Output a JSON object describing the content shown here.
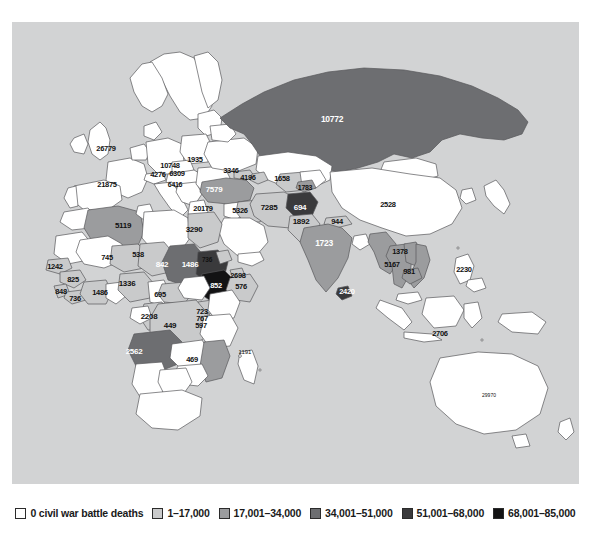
{
  "map": {
    "type": "choropleth-world-map",
    "ocean_color": "#d2d3d4",
    "border_color": "#58585a",
    "title": "",
    "note": "Civil war battle deaths by country, Eastern Hemisphere"
  },
  "legend": {
    "items": [
      {
        "label": "0 civil war battle deaths",
        "color": "#ffffff"
      },
      {
        "label": "1–17,000",
        "color": "#c9cacb"
      },
      {
        "label": "17,001–34,000",
        "color": "#9b9c9e"
      },
      {
        "label": "34,001–51,000",
        "color": "#6d6e71"
      },
      {
        "label": "51,001–68,000",
        "color": "#3a3a3c"
      },
      {
        "label": "68,001–85,000",
        "color": "#131314"
      }
    ]
  },
  "labels": [
    {
      "id": "united-kingdom",
      "value": "26779",
      "x": 94,
      "y": 127,
      "size": 7.5,
      "dark": false
    },
    {
      "id": "spain",
      "value": "21875",
      "x": 95,
      "y": 163,
      "size": 7.5,
      "dark": false
    },
    {
      "id": "germany",
      "value": "10748",
      "x": 158,
      "y": 144,
      "size": 7.5,
      "dark": false
    },
    {
      "id": "austria",
      "value": "6309",
      "x": 165,
      "y": 152,
      "size": 7.5,
      "dark": false
    },
    {
      "id": "france-east",
      "value": "4276",
      "x": 146,
      "y": 153,
      "size": 7.5,
      "dark": false
    },
    {
      "id": "balkans",
      "value": "6416",
      "x": 163,
      "y": 162,
      "size": 7,
      "dark": false
    },
    {
      "id": "poland",
      "value": "1935",
      "x": 183,
      "y": 138,
      "size": 7.5,
      "dark": false
    },
    {
      "id": "georgia",
      "value": "3346",
      "x": 219,
      "y": 149,
      "size": 7.5,
      "dark": false
    },
    {
      "id": "azerbaijan",
      "value": "4196",
      "x": 236,
      "y": 156,
      "size": 7.5,
      "dark": false
    },
    {
      "id": "turkey",
      "value": "7579",
      "x": 202,
      "y": 168,
      "size": 8,
      "dark": true
    },
    {
      "id": "turkmenistan",
      "value": "1658",
      "x": 270,
      "y": 157,
      "size": 7.5,
      "dark": false
    },
    {
      "id": "tajikistan",
      "value": "1783",
      "x": 293,
      "y": 165,
      "size": 7,
      "dark": false
    },
    {
      "id": "russia",
      "value": "10772",
      "x": 320,
      "y": 97,
      "size": 8.5,
      "dark": true
    },
    {
      "id": "egypt",
      "value": "20179",
      "x": 191,
      "y": 187,
      "size": 7.5,
      "dark": false
    },
    {
      "id": "iraq",
      "value": "5326",
      "x": 228,
      "y": 189,
      "size": 7.5,
      "dark": false
    },
    {
      "id": "iran",
      "value": "7285",
      "x": 257,
      "y": 186,
      "size": 8,
      "dark": false
    },
    {
      "id": "afghanistan",
      "value": "694",
      "x": 288,
      "y": 186,
      "size": 8,
      "dark": true
    },
    {
      "id": "pakistan",
      "value": "1892",
      "x": 289,
      "y": 200,
      "size": 8,
      "dark": false
    },
    {
      "id": "china",
      "value": "2528",
      "x": 376,
      "y": 183,
      "size": 7.5,
      "dark": false
    },
    {
      "id": "nepal",
      "value": "944",
      "x": 325,
      "y": 200,
      "size": 7.5,
      "dark": false
    },
    {
      "id": "india",
      "value": "1723",
      "x": 312,
      "y": 221,
      "size": 8.5,
      "dark": true
    },
    {
      "id": "sri-lanka",
      "value": "2420",
      "x": 335,
      "y": 270,
      "size": 7.5,
      "dark": true
    },
    {
      "id": "sudan-chad",
      "value": "3290",
      "x": 182,
      "y": 208,
      "size": 8,
      "dark": false
    },
    {
      "id": "algeria",
      "value": "5119",
      "x": 111,
      "y": 204,
      "size": 8,
      "dark": false
    },
    {
      "id": "niger",
      "value": "745",
      "x": 95,
      "y": 236,
      "size": 7.5,
      "dark": false
    },
    {
      "id": "chad",
      "value": "538",
      "x": 126,
      "y": 233,
      "size": 7.5,
      "dark": false
    },
    {
      "id": "sudan",
      "value": "842",
      "x": 150,
      "y": 243,
      "size": 8,
      "dark": true
    },
    {
      "id": "ethiopia-region",
      "value": "1486",
      "x": 178,
      "y": 243,
      "size": 8,
      "dark": true
    },
    {
      "id": "eritrea",
      "value": "736",
      "x": 195,
      "y": 238,
      "size": 6.5,
      "dark": false
    },
    {
      "id": "djibouti",
      "value": "2698",
      "x": 226,
      "y": 254,
      "size": 7.5,
      "dark": false
    },
    {
      "id": "somalia",
      "value": "576",
      "x": 229,
      "y": 265,
      "size": 7.5,
      "dark": false
    },
    {
      "id": "ethiopia",
      "value": "852",
      "x": 204,
      "y": 264,
      "size": 7.5,
      "dark": true
    },
    {
      "id": "senegal",
      "value": "1242",
      "x": 43,
      "y": 245,
      "size": 7.5,
      "dark": false
    },
    {
      "id": "guinea",
      "value": "825",
      "x": 61,
      "y": 258,
      "size": 7.5,
      "dark": false
    },
    {
      "id": "sierra-leone",
      "value": "848",
      "x": 49,
      "y": 270,
      "size": 7.5,
      "dark": false
    },
    {
      "id": "liberia",
      "value": "736",
      "x": 63,
      "y": 277,
      "size": 7.5,
      "dark": false
    },
    {
      "id": "ivory-coast",
      "value": "1486",
      "x": 88,
      "y": 271,
      "size": 7.5,
      "dark": false
    },
    {
      "id": "nigeria",
      "value": "1336",
      "x": 115,
      "y": 262,
      "size": 8,
      "dark": false
    },
    {
      "id": "car",
      "value": "695",
      "x": 148,
      "y": 273,
      "size": 7.5,
      "dark": false
    },
    {
      "id": "uganda",
      "value": "723",
      "x": 190,
      "y": 290,
      "size": 7.5,
      "dark": false
    },
    {
      "id": "rwanda",
      "value": "767",
      "x": 190,
      "y": 297,
      "size": 7.5,
      "dark": false
    },
    {
      "id": "burundi",
      "value": "597",
      "x": 189,
      "y": 304,
      "size": 7.5,
      "dark": false
    },
    {
      "id": "congo",
      "value": "2208",
      "x": 137,
      "y": 295,
      "size": 8,
      "dark": false
    },
    {
      "id": "drc",
      "value": "449",
      "x": 158,
      "y": 304,
      "size": 8,
      "dark": false
    },
    {
      "id": "angola",
      "value": "2562",
      "x": 122,
      "y": 330,
      "size": 8,
      "dark": true
    },
    {
      "id": "mozambique",
      "value": "469",
      "x": 180,
      "y": 338,
      "size": 7.5,
      "dark": false
    },
    {
      "id": "indian-ocean-pt",
      "value": "1191",
      "x": 233,
      "y": 330,
      "size": 6,
      "dark": false
    },
    {
      "id": "myanmar",
      "value": "1378",
      "x": 388,
      "y": 230,
      "size": 7.5,
      "dark": false
    },
    {
      "id": "thailand",
      "value": "5167",
      "x": 380,
      "y": 243,
      "size": 7.5,
      "dark": false
    },
    {
      "id": "cambodia",
      "value": "981",
      "x": 397,
      "y": 250,
      "size": 7.5,
      "dark": false
    },
    {
      "id": "philippines",
      "value": "2230",
      "x": 452,
      "y": 248,
      "size": 7.5,
      "dark": false
    },
    {
      "id": "indonesia",
      "value": "2706",
      "x": 428,
      "y": 312,
      "size": 7.5,
      "dark": false
    },
    {
      "id": "australia",
      "value": "29970",
      "x": 477,
      "y": 373,
      "size": 5,
      "dark": false
    }
  ]
}
